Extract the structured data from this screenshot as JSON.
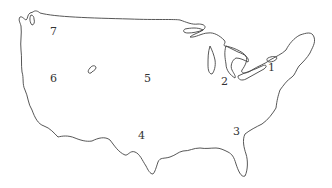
{
  "map": {
    "title": "United States outline map",
    "stroke_color": "#444444",
    "background": "#ffffff",
    "regions": [
      {
        "label": "1",
        "x": 271,
        "y": 68
      },
      {
        "label": "2",
        "x": 224,
        "y": 82
      },
      {
        "label": "3",
        "x": 234,
        "y": 131
      },
      {
        "label": "4",
        "x": 139,
        "y": 135
      },
      {
        "label": "5",
        "x": 145,
        "y": 74
      },
      {
        "label": "6",
        "x": 51,
        "y": 74
      },
      {
        "label": "7",
        "x": 51,
        "y": 27
      }
    ]
  }
}
